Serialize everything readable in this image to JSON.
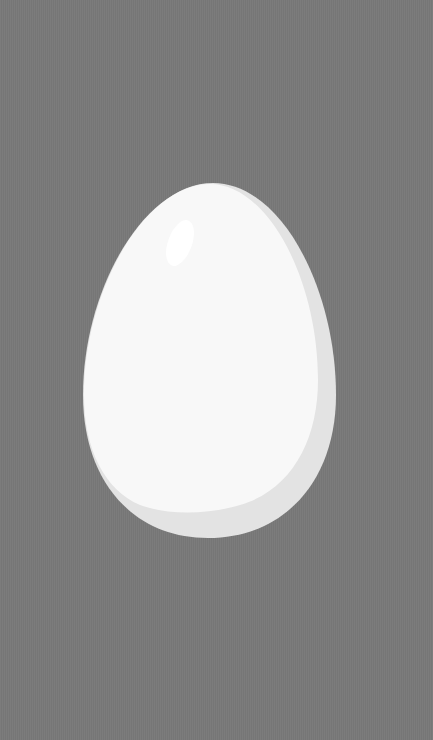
{
  "scene": {
    "subject": "egg",
    "background_color": "#7a7a7a",
    "egg_color": "#f7f7f7",
    "egg_shadow_color": "#e4e4e4",
    "highlight_color": "#ffffff"
  }
}
